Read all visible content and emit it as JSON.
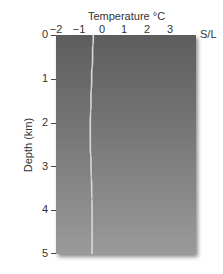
{
  "chart_data": {
    "type": "line",
    "title": "Temperature °C",
    "xlabel": "Temperature °C",
    "ylabel": "Depth (km)",
    "x_ticks": [
      "−2",
      "−1",
      "0",
      "1",
      "2",
      "3"
    ],
    "y_ticks": [
      "0",
      "1",
      "2",
      "3",
      "4",
      "5"
    ],
    "xlim": [
      -2,
      4.2
    ],
    "ylim": [
      5,
      0
    ],
    "annotations": [
      "S/L"
    ],
    "grid": false,
    "series": [
      {
        "name": "Temperature profile",
        "color": "#d8d8d8",
        "points": [
          {
            "depth": 0.0,
            "temp": -0.35
          },
          {
            "depth": 0.5,
            "temp": -0.38
          },
          {
            "depth": 1.0,
            "temp": -0.42
          },
          {
            "depth": 1.5,
            "temp": -0.45
          },
          {
            "depth": 2.0,
            "temp": -0.48
          },
          {
            "depth": 2.5,
            "temp": -0.48
          },
          {
            "depth": 3.0,
            "temp": -0.45
          },
          {
            "depth": 3.5,
            "temp": -0.42
          },
          {
            "depth": 4.0,
            "temp": -0.4
          },
          {
            "depth": 4.5,
            "temp": -0.4
          },
          {
            "depth": 5.0,
            "temp": -0.4
          }
        ]
      }
    ]
  }
}
